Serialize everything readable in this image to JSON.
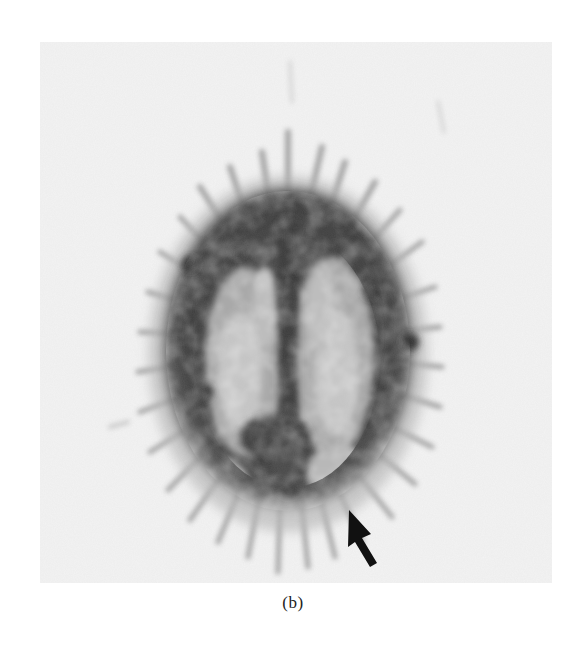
{
  "figure": {
    "caption": "(b)",
    "panel_background": "#f3f3f3",
    "page_background": "#ffffff",
    "annotation": {
      "type": "arrow",
      "color": "#111111",
      "direction": "up-left",
      "points_to": "posterior right cortical region"
    }
  }
}
